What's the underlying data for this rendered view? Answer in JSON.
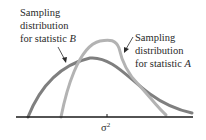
{
  "diagram": {
    "label_b": {
      "line1": "Sampling",
      "line2": "distribution",
      "line3_prefix": "for statistic ",
      "line3_var": "B"
    },
    "label_a": {
      "line1": "Sampling",
      "line2": "distribution",
      "line3_prefix": "for statistic ",
      "line3_var": "A"
    },
    "axis_tick_label": "σ",
    "axis_tick_sup": "2",
    "colors": {
      "curve_b": "#7f7f7f",
      "curve_a": "#b3b3b3",
      "axis": "#1a1a1a",
      "text": "#2a2a2a"
    }
  }
}
